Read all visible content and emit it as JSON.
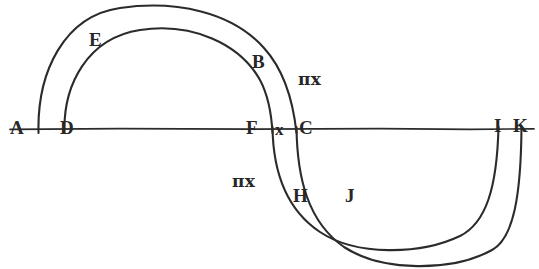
{
  "figure": {
    "type": "geometric-diagram",
    "title": "",
    "background_color": "#ffffff",
    "stroke_color": "#2b2b2b",
    "baseline": {
      "name": "horizontal-axis",
      "x1": 10,
      "y1": 129,
      "x2": 534,
      "y2": 129
    },
    "arcs": [
      {
        "id": "outer-upper",
        "from": "A",
        "to": "C",
        "side": "above",
        "x_left": 38,
        "x_right": 297,
        "apex_y": 7
      },
      {
        "id": "inner-upper",
        "from": "D",
        "to": "F",
        "side": "above",
        "x_left": 64,
        "x_right": 273,
        "apex_y": 28
      },
      {
        "id": "inner-lower",
        "from": "F",
        "to": "I",
        "side": "below",
        "x_left": 273,
        "x_right": 499,
        "apex_y": 245
      },
      {
        "id": "outer-lower",
        "from": "C",
        "to": "K",
        "side": "below",
        "x_left": 297,
        "x_right": 522,
        "apex_y": 263
      }
    ],
    "labels": [
      {
        "id": "A",
        "text": "A",
        "x": 10,
        "y": 118,
        "kind": "point"
      },
      {
        "id": "D",
        "text": "D",
        "x": 60,
        "y": 118,
        "kind": "point"
      },
      {
        "id": "E",
        "text": "E",
        "x": 89,
        "y": 30,
        "kind": "point"
      },
      {
        "id": "B",
        "text": "B",
        "x": 252,
        "y": 52,
        "kind": "point"
      },
      {
        "id": "F",
        "text": "F",
        "x": 246,
        "y": 118,
        "kind": "point"
      },
      {
        "id": "x",
        "text": "x",
        "x": 275,
        "y": 120,
        "kind": "point"
      },
      {
        "id": "C",
        "text": "C",
        "x": 299,
        "y": 118,
        "kind": "point"
      },
      {
        "id": "I",
        "text": "I",
        "x": 494,
        "y": 116,
        "kind": "point"
      },
      {
        "id": "K",
        "text": "K",
        "x": 513,
        "y": 116,
        "kind": "point"
      },
      {
        "id": "H",
        "text": "H",
        "x": 293,
        "y": 186,
        "kind": "point"
      },
      {
        "id": "J",
        "text": "J",
        "x": 345,
        "y": 186,
        "kind": "point"
      }
    ],
    "annotations": [
      {
        "id": "pix-upper",
        "pi": "π",
        "var": "x",
        "prime": "",
        "text": "πx",
        "x": 298,
        "y": 70
      },
      {
        "id": "pix-lower",
        "pi": "π",
        "var": "x",
        "prime": "",
        "text": "πx",
        "x": 232,
        "y": 172
      }
    ]
  }
}
